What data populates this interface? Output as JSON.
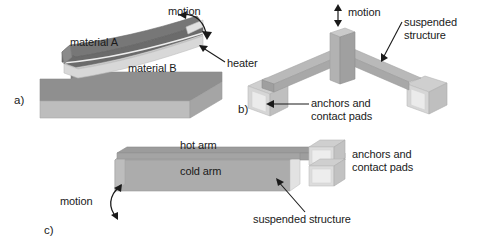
{
  "figure": {
    "background_color": "#ffffff",
    "width": 479,
    "height": 250
  },
  "palette": {
    "dark_gray": "#6e6e6e",
    "mid_gray": "#8f8f8f",
    "light_gray": "#b4b4b4",
    "pale_gray": "#cfcfcf",
    "very_pale_gray": "#dedede",
    "pad_face": "#e6e6e6",
    "outline": "#9a9a9a",
    "text": "#1a1a1a",
    "arrow": "#1a1a1a"
  },
  "panels": [
    {
      "id": "a",
      "tag": "a)",
      "name": "bimorph-cantilever",
      "labels": [
        {
          "id": "motion",
          "text": "motion"
        },
        {
          "id": "material_a",
          "text": "material A"
        },
        {
          "id": "material_b",
          "text": "material B"
        },
        {
          "id": "heater",
          "text": "heater"
        }
      ]
    },
    {
      "id": "b",
      "tag": "b)",
      "name": "chevron-v-beam-actuator",
      "labels": [
        {
          "id": "motion",
          "text": "motion"
        },
        {
          "id": "suspended_structure_line1",
          "text": "suspended"
        },
        {
          "id": "suspended_structure_line2",
          "text": "structure"
        },
        {
          "id": "anchors_line1",
          "text": "anchors and"
        },
        {
          "id": "anchors_line2",
          "text": "contact pads"
        }
      ]
    },
    {
      "id": "c",
      "tag": "c)",
      "name": "hot-arm-cold-arm-actuator",
      "labels": [
        {
          "id": "hot_arm",
          "text": "hot arm"
        },
        {
          "id": "cold_arm",
          "text": "cold arm"
        },
        {
          "id": "motion",
          "text": "motion"
        },
        {
          "id": "anchors_line1",
          "text": "anchors and"
        },
        {
          "id": "anchors_line2",
          "text": "contact pads"
        },
        {
          "id": "suspended_structure",
          "text": "suspended structure"
        }
      ]
    }
  ]
}
